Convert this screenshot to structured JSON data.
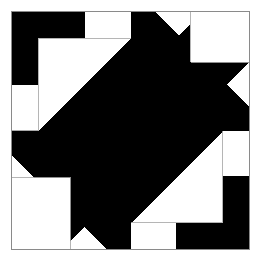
{
  "image": {
    "title": "Quilt Block Pattern",
    "width": 263,
    "height": 262,
    "background_color": "#ffffff",
    "description": "Monochrome pieced quilt block with 180-degree rotational symmetry"
  },
  "colors": {
    "background": "#ffffff",
    "patch_dark": "#000000",
    "patch_light": "#ffffff",
    "seam_line": "#8a8a8a",
    "block_border": "#8a8a8a"
  },
  "block": {
    "name": "zigzag-lightning-block",
    "x": 11,
    "y": 11,
    "width": 239,
    "height": 239,
    "grid_divisions": 4,
    "unit_size": 59.75,
    "symmetry": "180-degree rotational",
    "border_width": 1
  },
  "grid": {
    "vertical_lines": [
      11,
      70.75,
      130.5,
      190.25,
      250
    ],
    "horizontal_lines": [
      11,
      70.75,
      130.5,
      190.25,
      250
    ],
    "sub_lines_vertical": [
      38,
      62,
      85,
      108,
      155,
      178,
      202,
      226
    ],
    "sub_lines_horizontal": [
      38,
      62,
      85,
      108,
      155,
      178,
      202,
      226
    ]
  },
  "shapes": {
    "corner_l_top_left": {
      "name": "black-corner-l-top-left",
      "fill": "#000000",
      "points": "11,11 85,11 85,38 38,38 38,85 11,85"
    },
    "corner_l_bottom_right": {
      "name": "black-corner-l-bottom-right",
      "fill": "#000000",
      "points": "250,250 176,250 176,223 223,223 223,176 250,176"
    },
    "zigzag_main": {
      "name": "black-zigzag-band",
      "fill": "#000000",
      "points": "131,11 202,11 11,202 11,131 38,131 38,108 108,38 131,38"
    },
    "zigzag_upper_right": {
      "name": "black-zigzag-band-upper-right",
      "fill": "#000000",
      "points": "202,62 250,62 250,108 155,202 108,202 108,155"
    },
    "zigzag_lower_left": {
      "name": "black-zigzag-band-lower-left",
      "fill": "#000000",
      "points": "61,155 108,155 108,202 62,250 11,250 11,202"
    },
    "zigzag_lower_right": {
      "name": "black-zigzag-band-lower-right",
      "fill": "#000000",
      "points": "155,108 202,108 202,155 155,202 108,202 108,155"
    },
    "triangle_center_upper": {
      "name": "black-center-triangle-upper",
      "fill": "#000000",
      "points": "131,11 250,131 131,131"
    },
    "triangle_center_lower": {
      "name": "black-center-triangle-lower",
      "fill": "#000000",
      "points": "131,131 131,250 11,131"
    },
    "notch_top_white": {
      "name": "white-notch-top",
      "fill": "#ffffff",
      "points": "155,11 202,11 155,58"
    },
    "notch_right_white": {
      "name": "white-notch-right",
      "fill": "#ffffff",
      "points": "155,11 250,11 250,62 202,62"
    },
    "notch_bottom_white": {
      "name": "white-notch-bottom",
      "fill": "#ffffff",
      "points": "11,250 62,250 108,202 61,202"
    },
    "notch_left_white": {
      "name": "white-notch-left",
      "fill": "#ffffff",
      "points": "11,155 61,155 61,202 11,202"
    },
    "white_square_bottom_left": {
      "name": "white-square-bottom-left",
      "fill": "#ffffff",
      "points": "11,178 70,178 70,250 11,250"
    },
    "white_square_top_right": {
      "name": "white-square-top-right",
      "fill": "#ffffff",
      "points": "190,11 250,11 250,62 190,62"
    }
  },
  "seams": {
    "lines": [
      {
        "name": "seam-vertical-center",
        "x1": 130.5,
        "y1": 11,
        "x2": 130.5,
        "y2": 250
      },
      {
        "name": "seam-horizontal-center",
        "x1": 11,
        "y1": 130.5,
        "x2": 250,
        "y2": 130.5
      },
      {
        "name": "seam-vertical-left-quarter",
        "x1": 38,
        "y1": 11,
        "x2": 38,
        "y2": 250
      },
      {
        "name": "seam-vertical-right-quarter",
        "x1": 223,
        "y1": 11,
        "x2": 223,
        "y2": 250
      },
      {
        "name": "seam-horizontal-top-quarter",
        "x1": 11,
        "y1": 38,
        "x2": 250,
        "y2": 38
      },
      {
        "name": "seam-horizontal-bottom-quarter",
        "x1": 11,
        "y1": 223,
        "x2": 250,
        "y2": 223
      },
      {
        "name": "seam-vertical-left-eighth",
        "x1": 70.75,
        "y1": 130.5,
        "x2": 70.75,
        "y2": 250
      },
      {
        "name": "seam-vertical-right-eighth",
        "x1": 190.25,
        "y1": 11,
        "x2": 190.25,
        "y2": 130.5
      },
      {
        "name": "seam-horizontal-upper",
        "x1": 130.5,
        "y1": 62,
        "x2": 250,
        "y2": 62
      },
      {
        "name": "seam-horizontal-lower",
        "x1": 11,
        "y1": 202,
        "x2": 130.5,
        "y2": 202
      },
      {
        "name": "seam-horizontal-mid-upper",
        "x1": 130.5,
        "y1": 190.25,
        "x2": 250,
        "y2": 190.25
      },
      {
        "name": "seam-horizontal-mid-lower",
        "x1": 11,
        "y1": 70.75,
        "x2": 130.5,
        "y2": 70.75
      }
    ]
  }
}
